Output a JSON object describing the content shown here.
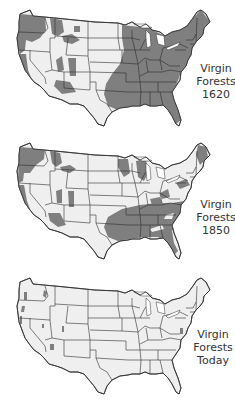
{
  "figure": {
    "type": "map-series",
    "region": "Contiguous United States",
    "colors": {
      "forest": "#7f7f7f",
      "land": "#efefef",
      "borders": "#2e2e2e",
      "background": "#ffffff",
      "text": "#333333"
    },
    "maps": [
      {
        "title_line1": "Virgin",
        "title_line2": "Forests",
        "title_line3": "1620",
        "forest_coverage": "extensive"
      },
      {
        "title_line1": "Virgin",
        "title_line2": "Forests",
        "title_line3": "1850",
        "forest_coverage": "moderate"
      },
      {
        "title_line1": "Virgin",
        "title_line2": "Forests",
        "title_line3": "Today",
        "forest_coverage": "minimal"
      }
    ]
  }
}
